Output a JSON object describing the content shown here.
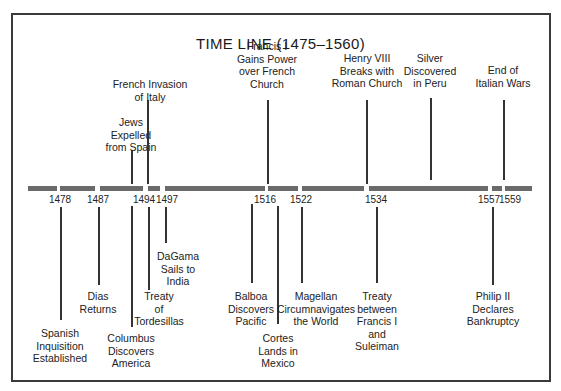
{
  "title": "TIME LINE (1475–1560)",
  "timeline": {
    "start_year": 1475,
    "end_year": 1560,
    "bar_color": "#6a6a6a",
    "segments": [
      {
        "x1": 28,
        "x2": 57
      },
      {
        "x1": 60,
        "x2": 95
      },
      {
        "x1": 100,
        "x2": 143
      },
      {
        "x1": 148,
        "x2": 160
      },
      {
        "x1": 165,
        "x2": 265
      },
      {
        "x1": 268,
        "x2": 298
      },
      {
        "x1": 302,
        "x2": 364
      },
      {
        "x1": 369,
        "x2": 488
      },
      {
        "x1": 492,
        "x2": 502
      },
      {
        "x1": 505,
        "x2": 532
      }
    ],
    "year_labels": [
      {
        "year": "1478",
        "x": 60
      },
      {
        "year": "1487",
        "x": 98
      },
      {
        "year": "1494",
        "x": 144
      },
      {
        "year": "1497",
        "x": 167
      },
      {
        "year": "1516",
        "x": 265
      },
      {
        "year": "1522",
        "x": 301
      },
      {
        "year": "1534",
        "x": 376
      },
      {
        "year": "1557",
        "x": 489
      },
      {
        "year": "1559",
        "x": 510
      }
    ]
  },
  "events_above": [
    {
      "lines": [
        "Jews",
        "Expelled",
        "from Spain"
      ],
      "x": 131,
      "label_top": 116,
      "line_top": 150,
      "line_bottom": 184
    },
    {
      "lines": [
        "French Invasion",
        "of Italy"
      ],
      "x": 150,
      "label_top": 78,
      "line_top": 100,
      "line_bottom": 184,
      "line_x": 147
    },
    {
      "lines": [
        "Francis I",
        "Gains Power",
        "over French",
        "Church"
      ],
      "x": 267,
      "label_top": 40,
      "line_top": 100,
      "line_bottom": 184
    },
    {
      "lines": [
        "Henry VIII",
        "Breaks with",
        "Roman Church"
      ],
      "x": 367,
      "label_top": 52,
      "line_top": 100,
      "line_bottom": 184,
      "line_x": 366
    },
    {
      "lines": [
        "Silver",
        "Discovered",
        "in Peru"
      ],
      "x": 430,
      "label_top": 52,
      "line_top": 98,
      "line_bottom": 180
    },
    {
      "lines": [
        "End of",
        "Italian Wars"
      ],
      "x": 503,
      "label_top": 64,
      "line_top": 100,
      "line_bottom": 180
    }
  ],
  "events_below": [
    {
      "lines": [
        "Spanish",
        "Inquisition",
        "Established"
      ],
      "x": 60,
      "label_top": 327,
      "line_top": 207,
      "line_bottom": 320
    },
    {
      "lines": [
        "Dias",
        "Returns"
      ],
      "x": 98,
      "label_top": 290,
      "line_top": 207,
      "line_bottom": 285
    },
    {
      "lines": [
        "Columbus",
        "Discovers",
        "America"
      ],
      "x": 131,
      "label_top": 332,
      "line_top": 206,
      "line_bottom": 327
    },
    {
      "lines": [
        "Treaty",
        "of",
        "Tordesillas"
      ],
      "x": 159,
      "label_top": 290,
      "line_top": 207,
      "line_bottom": 290,
      "line_x": 148
    },
    {
      "lines": [
        "DaGama",
        "Sails to",
        "India"
      ],
      "x": 178,
      "label_top": 250,
      "line_top": 207,
      "line_bottom": 243,
      "line_x": 165
    },
    {
      "lines": [
        "Balboa",
        "Discovers",
        "Pacific"
      ],
      "x": 251,
      "label_top": 290,
      "line_top": 204,
      "line_bottom": 283
    },
    {
      "lines": [
        "Cortes",
        "Lands in",
        "Mexico"
      ],
      "x": 278,
      "label_top": 332,
      "line_top": 206,
      "line_bottom": 324,
      "line_x": 277
    },
    {
      "lines": [
        "Magellan",
        "Circumnavigates",
        "the World"
      ],
      "x": 316,
      "label_top": 290,
      "line_top": 207,
      "line_bottom": 283,
      "line_x": 301
    },
    {
      "lines": [
        "Treaty",
        "between",
        "Francis I",
        "and",
        "Suleiman"
      ],
      "x": 377,
      "label_top": 290,
      "line_top": 207,
      "line_bottom": 283,
      "line_x": 376
    },
    {
      "lines": [
        "Philip II",
        "Declares",
        "Bankruptcy"
      ],
      "x": 493,
      "label_top": 290,
      "line_top": 207,
      "line_bottom": 285,
      "line_x": 492
    }
  ]
}
